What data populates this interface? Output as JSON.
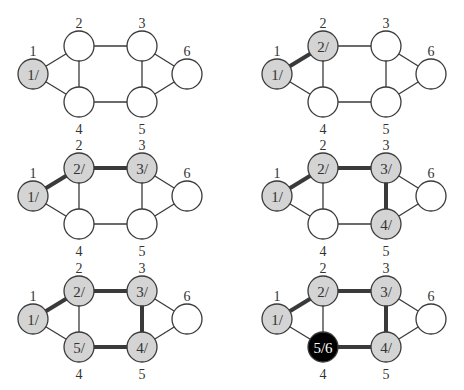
{
  "figure": {
    "colors": {
      "unvisited": "#ffffff",
      "discovered": "#d4d4d4",
      "finished": "#000000",
      "edge": "#3a3a3a"
    },
    "vertex_positions": {
      "1": [
        33,
        74
      ],
      "2": [
        79,
        46
      ],
      "3": [
        142,
        46
      ],
      "4": [
        79,
        102
      ],
      "5": [
        142,
        102
      ],
      "6": [
        187,
        74
      ]
    },
    "vertex_label_offsets": {
      "1": [
        0,
        -23
      ],
      "2": [
        0,
        -23
      ],
      "3": [
        0,
        -23
      ],
      "6": [
        0,
        -23
      ],
      "4": [
        0,
        27
      ],
      "5": [
        0,
        27
      ]
    },
    "edges": [
      [
        1,
        2
      ],
      [
        1,
        4
      ],
      [
        2,
        3
      ],
      [
        2,
        4
      ],
      [
        3,
        5
      ],
      [
        4,
        5
      ],
      [
        3,
        6
      ],
      [
        5,
        6
      ]
    ],
    "panels": [
      {
        "id": "step-1",
        "offset": [
          0,
          0
        ],
        "nodes": {
          "1": {
            "state": "gray",
            "text": "1/"
          }
        },
        "tree_edges": []
      },
      {
        "id": "step-2",
        "offset": [
          244,
          0
        ],
        "nodes": {
          "1": {
            "state": "gray",
            "text": "1/"
          },
          "2": {
            "state": "gray",
            "text": "2/"
          }
        },
        "tree_edges": [
          [
            1,
            2
          ]
        ]
      },
      {
        "id": "step-3",
        "offset": [
          0,
          122
        ],
        "nodes": {
          "1": {
            "state": "gray",
            "text": "1/"
          },
          "2": {
            "state": "gray",
            "text": "2/"
          },
          "3": {
            "state": "gray",
            "text": "3/"
          }
        },
        "tree_edges": [
          [
            1,
            2
          ],
          [
            2,
            3
          ]
        ]
      },
      {
        "id": "step-4",
        "offset": [
          244,
          122
        ],
        "nodes": {
          "1": {
            "state": "gray",
            "text": "1/"
          },
          "2": {
            "state": "gray",
            "text": "2/"
          },
          "3": {
            "state": "gray",
            "text": "3/"
          },
          "5": {
            "state": "gray",
            "text": "4/"
          }
        },
        "tree_edges": [
          [
            1,
            2
          ],
          [
            2,
            3
          ],
          [
            3,
            5
          ]
        ]
      },
      {
        "id": "step-5",
        "offset": [
          0,
          245
        ],
        "nodes": {
          "1": {
            "state": "gray",
            "text": "1/"
          },
          "2": {
            "state": "gray",
            "text": "2/"
          },
          "3": {
            "state": "gray",
            "text": "3/"
          },
          "5": {
            "state": "gray",
            "text": "4/"
          },
          "4": {
            "state": "gray",
            "text": "5/"
          }
        },
        "tree_edges": [
          [
            1,
            2
          ],
          [
            2,
            3
          ],
          [
            3,
            5
          ],
          [
            4,
            5
          ]
        ]
      },
      {
        "id": "step-6",
        "offset": [
          244,
          245
        ],
        "nodes": {
          "1": {
            "state": "gray",
            "text": "1/"
          },
          "2": {
            "state": "gray",
            "text": "2/"
          },
          "3": {
            "state": "gray",
            "text": "3/"
          },
          "5": {
            "state": "gray",
            "text": "4/"
          },
          "4": {
            "state": "black",
            "text": "5/6"
          }
        },
        "tree_edges": [
          [
            1,
            2
          ],
          [
            2,
            3
          ],
          [
            3,
            5
          ],
          [
            4,
            5
          ]
        ]
      }
    ],
    "node_radius": 15
  }
}
